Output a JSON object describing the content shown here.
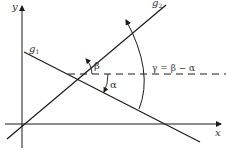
{
  "diagram": {
    "axes": {
      "x_label": "x",
      "y_label": "y"
    },
    "lines": [
      {
        "name": "g",
        "subscript": "1"
      },
      {
        "name": "g",
        "subscript": "2"
      }
    ],
    "angles": {
      "beta": "β",
      "alpha": "α",
      "gamma_formula": "γ = β − α"
    },
    "colors": {
      "stroke": "#1a1a1a",
      "text": "#333333"
    }
  }
}
